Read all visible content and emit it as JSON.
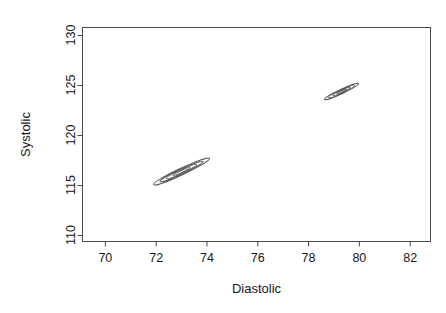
{
  "page": {
    "header_text": "",
    "page_number": ""
  },
  "chart_data": {
    "type": "scatter",
    "title": "",
    "xlabel": "Diastolic",
    "ylabel": "Systolic",
    "xlim": [
      69.1,
      82.8
    ],
    "ylim": [
      109.4,
      130.8
    ],
    "xticks": [
      70,
      72,
      74,
      76,
      78,
      80,
      82
    ],
    "xtick_labels": [
      "70",
      "72",
      "74",
      "76",
      "78",
      "80",
      "82"
    ],
    "yticks": [
      110,
      115,
      120,
      125,
      130
    ],
    "ytick_labels": [
      "110",
      "115",
      "120",
      "125",
      "130"
    ],
    "grid": false,
    "legend": "none",
    "box": true,
    "line_color": "#555555",
    "series": [
      {
        "name": "cluster-1",
        "kind": "contour-ellipses",
        "center": [
          73.0,
          116.4
        ],
        "angle_deg": -25,
        "rings": [
          {
            "level": 1,
            "semi_major": 1.22,
            "semi_minor": 0.33
          },
          {
            "level": 2,
            "semi_major": 0.94,
            "semi_minor": 0.25
          },
          {
            "level": 3,
            "semi_major": 0.66,
            "semi_minor": 0.17
          },
          {
            "level": 4,
            "semi_major": 0.38,
            "semi_minor": 0.1
          }
        ]
      },
      {
        "name": "cluster-2",
        "kind": "contour-ellipses",
        "center": [
          79.3,
          124.4
        ],
        "angle_deg": -25,
        "rings": [
          {
            "level": 1,
            "semi_major": 0.74,
            "semi_minor": 0.22
          },
          {
            "level": 2,
            "semi_major": 0.56,
            "semi_minor": 0.17
          },
          {
            "level": 3,
            "semi_major": 0.38,
            "semi_minor": 0.12
          },
          {
            "level": 4,
            "semi_major": 0.21,
            "semi_minor": 0.07
          }
        ]
      }
    ]
  }
}
